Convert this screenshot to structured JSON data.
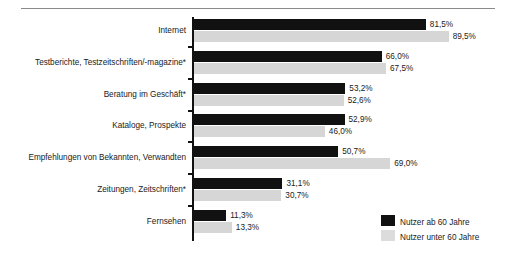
{
  "chart_data": {
    "type": "bar",
    "title": "",
    "subtitle": "",
    "xlabel": "",
    "ylabel": "",
    "orientation": "horizontal",
    "grid": false,
    "legend_position": "bottom-right",
    "xlim": [
      0,
      100
    ],
    "unit": "%",
    "categories": [
      "Internet",
      "Testberichte, Testzeitschriften/-magazine*",
      "Beratung im Geschäft*",
      "Kataloge, Prospekte",
      "Empfehlungen von Bekannten, Verwandten",
      "Zeitungen, Zeitschriften*",
      "Fernsehen"
    ],
    "series": [
      {
        "name": "Nutzer ab 60 Jahre",
        "color": "#111111",
        "values": [
          81.5,
          66.0,
          53.2,
          52.9,
          50.7,
          31.1,
          11.3
        ],
        "labels": [
          "81,5%",
          "66,0%",
          "53,2%",
          "52,9%",
          "50,7%",
          "31,1%",
          "11,3%"
        ]
      },
      {
        "name": "Nutzer unter 60 Jahre",
        "color": "#d6d6d6",
        "values": [
          89.5,
          67.5,
          52.6,
          46.0,
          69.0,
          30.7,
          13.3
        ],
        "labels": [
          "89,5%",
          "67,5%",
          "52,6%",
          "46,0%",
          "69,0%",
          "30,7%",
          "13,3%"
        ]
      }
    ]
  },
  "legend": {
    "items": [
      {
        "label": "Nutzer ab 60 Jahre",
        "color": "#111111"
      },
      {
        "label": "Nutzer unter 60 Jahre",
        "color": "#dcdcdc"
      }
    ]
  }
}
